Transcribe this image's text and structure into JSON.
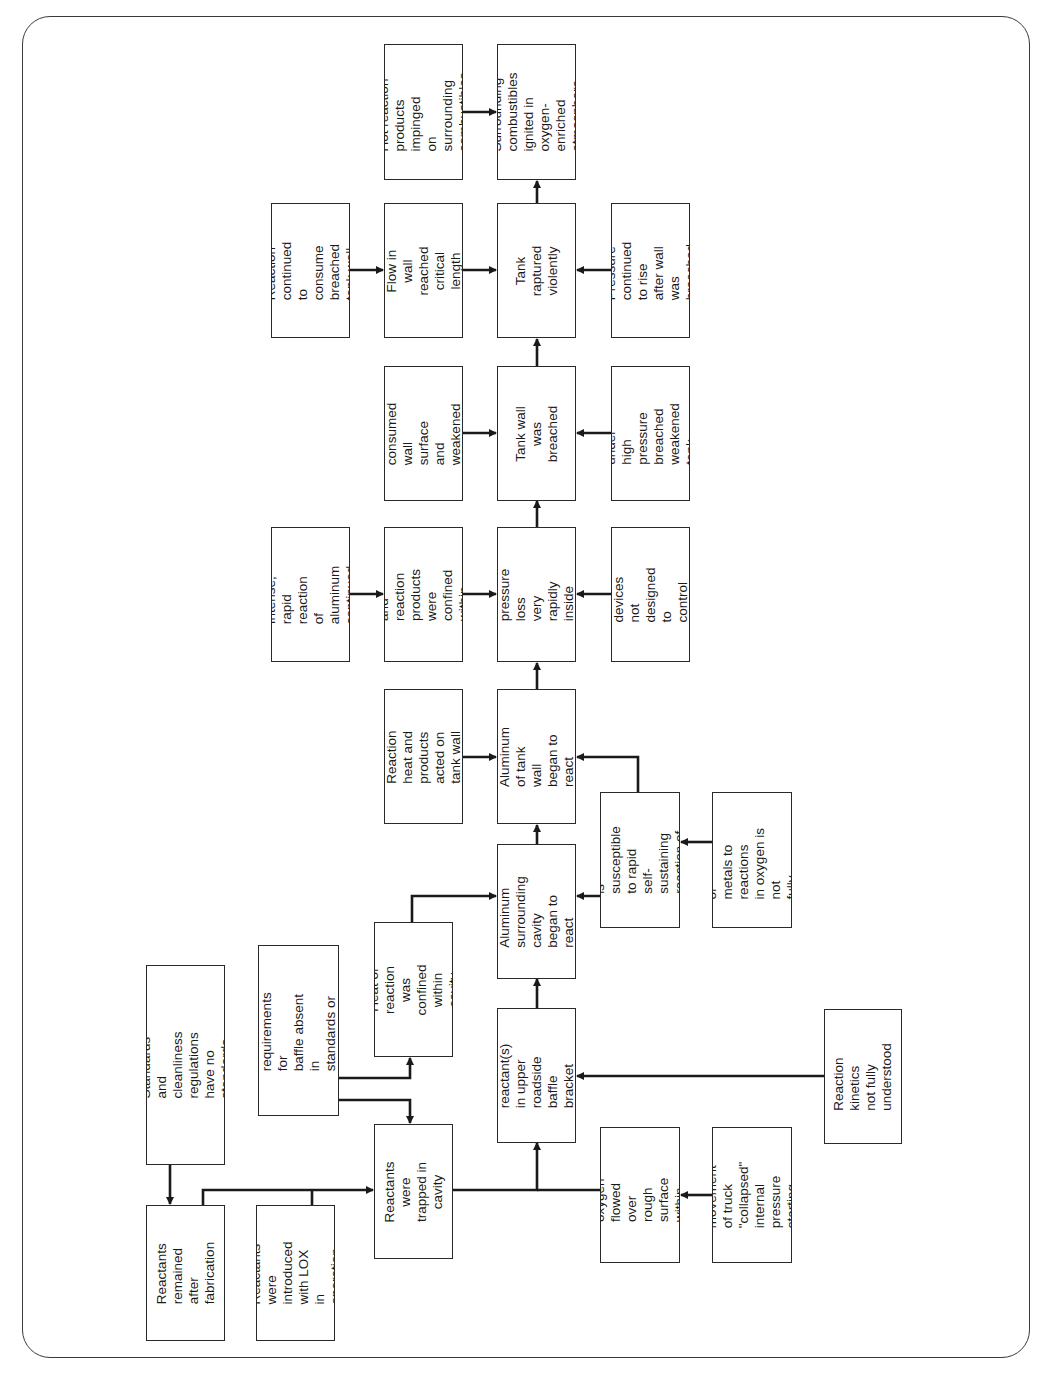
{
  "diagram": {
    "type": "fault-tree / event sequence flowchart",
    "orientation": "rotated 90° counter-clockwise (flow runs bottom to top)",
    "nodes": {
      "standards_cleanliness": "Standards and\ncleanliness\nregulations have no\nstandards",
      "reactants_remained": "Reactants remained\nafter fabrication",
      "reactants_introduced": "Reactants were\nintroduced with LOX\nin operation",
      "configuration_requirements": "Configuration\nrequirements for\nbaffle absent in\nstandards or permits",
      "reactants_trapped": "Reactants were\ntrapped in cavity",
      "heat_confined_cavity": "Heat of reaction\nwas confined\nwithin cavity",
      "oxidation_began": "Oxidation of\nreactant(s) in upper\nroadside baffle\nbracket cavity began",
      "gaseous_oxygen": "Gaseous oxygen\nflowed over rough\nsurface within\ncavity",
      "normal_movement": "Normal movement\nof truck \"collapsed\"\ninternal pressure\nstarting gas flow",
      "aluminum_cavity_react": "Aluminum\nsurrounding cavity\nbegan to react",
      "aluminum_susceptible": "Aluminum is\nsusceptible to rapid\nself-sustaining\nreaction of oxygen",
      "susceptibility_metals": "Susceptibility of\nmetals to reactions\nin oxygen is not\nfully understood",
      "reaction_kinetics": "Reaction kinetics\nnot fully understood",
      "reaction_heat_acted": "Reaction heat and\nproducts acted on\ntank wall",
      "aluminum_wall_react": "Aluminum of tank\nwall began to\nreact",
      "intense_reaction": "Intense, rapid\nreaction of\naluminum\ncontinued",
      "heat_products_confined_tank": "Heat and reaction\nproducts were\nconfined within\ntank",
      "internal_pressure": "Internal pressure\nloss very rapidly\ninside tank",
      "safety_relief": "Safety relief devices\nnot designed to\ncontrol this event",
      "reaction_consumed_wall": "Reaction consumed\nwall surface and\nweakened tank well",
      "tank_wall_breached": "Tank wall was\nbreached",
      "gas_high_pressure": "Gas under high\npressure breached\nweakened tank\nwell",
      "reaction_continued": "Reaction continued\nto consume\nbreached tank well",
      "flow_in_wall": "Flow in wall\nreached\ncritical length",
      "tank_raptured": "Tank raptured\nviolently",
      "pressure_continued": "Pressure continued\nto rise after wall was\nbreached",
      "hot_reaction_products": "Hot reaction\nproducts impinged\non surrounding\ncombustibles",
      "surrounding_ignited": "Surrounding\ncombustibles\nignited in\noxygen-enriched\natmosphere"
    },
    "edges": [
      [
        "standards_cleanliness",
        "reactants_remained"
      ],
      [
        "reactants_remained",
        "reactants_trapped"
      ],
      [
        "reactants_introduced",
        "reactants_trapped"
      ],
      [
        "configuration_requirements",
        "heat_confined_cavity"
      ],
      [
        "configuration_requirements",
        "reactants_trapped"
      ],
      [
        "reactants_trapped",
        "oxidation_began"
      ],
      [
        "gaseous_oxygen",
        "oxidation_began"
      ],
      [
        "normal_movement",
        "gaseous_oxygen"
      ],
      [
        "reaction_kinetics",
        "oxidation_began"
      ],
      [
        "heat_confined_cavity",
        "aluminum_cavity_react"
      ],
      [
        "oxidation_began",
        "aluminum_cavity_react"
      ],
      [
        "susceptibility_metals",
        "aluminum_susceptible"
      ],
      [
        "aluminum_susceptible",
        "aluminum_cavity_react"
      ],
      [
        "aluminum_susceptible",
        "aluminum_wall_react"
      ],
      [
        "aluminum_cavity_react",
        "aluminum_wall_react"
      ],
      [
        "reaction_heat_acted",
        "aluminum_wall_react"
      ],
      [
        "aluminum_wall_react",
        "internal_pressure"
      ],
      [
        "intense_reaction",
        "heat_products_confined_tank"
      ],
      [
        "heat_products_confined_tank",
        "internal_pressure"
      ],
      [
        "safety_relief",
        "internal_pressure"
      ],
      [
        "internal_pressure",
        "tank_wall_breached"
      ],
      [
        "reaction_consumed_wall",
        "tank_wall_breached"
      ],
      [
        "gas_high_pressure",
        "tank_wall_breached"
      ],
      [
        "tank_wall_breached",
        "tank_raptured"
      ],
      [
        "reaction_continued",
        "flow_in_wall"
      ],
      [
        "flow_in_wall",
        "tank_raptured"
      ],
      [
        "pressure_continued",
        "tank_raptured"
      ],
      [
        "tank_raptured",
        "surrounding_ignited"
      ],
      [
        "hot_reaction_products",
        "surrounding_ignited"
      ]
    ]
  },
  "colors": {
    "line": "#1a1a1a",
    "box_border": "#2a2a2a",
    "background": "#ffffff"
  }
}
